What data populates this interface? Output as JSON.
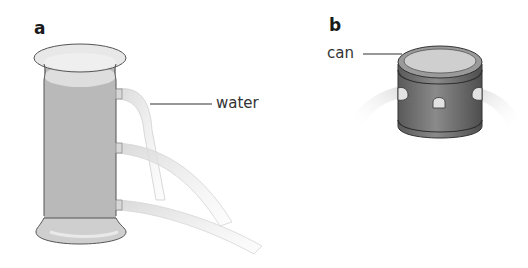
{
  "panels": {
    "a": {
      "label": "a",
      "callout": "water",
      "object": "tall cylinder with three side holes at different heights",
      "jets": 3
    },
    "b": {
      "label": "b",
      "callout": "can",
      "object": "short can with holes around its base",
      "jets": 3
    }
  },
  "colors": {
    "vessel_fill": "#b9b9b9",
    "vessel_outline": "#555555",
    "rim_fill": "#e6e6e6",
    "water_surface": "#dcdcdc",
    "jet_fill": "#e3e3e3",
    "can_body": "#7c7c7c",
    "can_top": "#cfcfcf",
    "leader_line": "#333333"
  }
}
